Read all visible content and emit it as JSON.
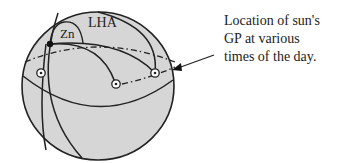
{
  "diagram": {
    "labels": {
      "lha": "LHA",
      "zn": "Zn"
    },
    "caption": {
      "lines": [
        "Location of sun's",
        "GP at various",
        "times of the day."
      ]
    },
    "colors": {
      "sphere_fill": "#d6d6d6",
      "stroke": "#222222",
      "background": "#ffffff"
    },
    "gp_markers": 3
  }
}
